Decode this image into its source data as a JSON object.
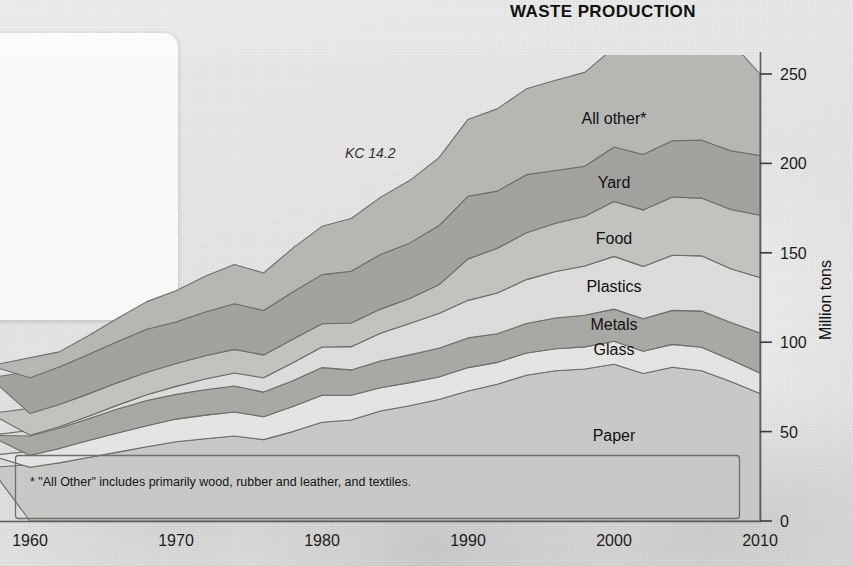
{
  "card": {
    "heading": "we\nle?",
    "subhead": "rents did.",
    "body": "olid waste in\nastic products\ncovery rates\ntes plastics\ncause"
  },
  "chart": {
    "title": "WASTE PRODUCTION",
    "annotation": "KC 14.2",
    "footnote": "* \"All Other\" includes primarily wood, rubber and leather, and textiles.",
    "y_axis_title": "Million tons"
  },
  "colors": {
    "band_paper": "#c9cac7",
    "band_glass": "#e5e6e3",
    "band_metals": "#a9aaa6",
    "band_plastics": "#dddedb",
    "band_food": "#c3c4c0",
    "band_yard": "#a3a4a0",
    "band_all_other": "#b7b8b4",
    "stroke": "#6e6f6b",
    "axis": "#5c5d5a",
    "text": "#141414"
  },
  "chart_data": {
    "type": "area",
    "title": "WASTE PRODUCTION",
    "xlabel": "",
    "ylabel": "Million tons",
    "xlim": [
      1960,
      2010
    ],
    "ylim": [
      0,
      250
    ],
    "yticks": [
      0,
      50,
      100,
      150,
      200,
      250
    ],
    "xticks": [
      1960,
      1970,
      1980,
      1990,
      2000,
      2010
    ],
    "grid": false,
    "legend": "inline-labels",
    "stacked": true,
    "x": [
      1960,
      1962,
      1964,
      1966,
      1968,
      1970,
      1972,
      1974,
      1976,
      1978,
      1980,
      1982,
      1984,
      1986,
      1988,
      1990,
      1992,
      1994,
      1996,
      1998,
      2000,
      2002,
      2004,
      2006,
      2008,
      2010
    ],
    "series": [
      {
        "name": "Paper",
        "values": [
          30.0,
          32.5,
          35.5,
          38.5,
          41.5,
          44.3,
          46.0,
          47.5,
          45.5,
          50.0,
          55.2,
          56.5,
          61.5,
          64.5,
          68.0,
          72.7,
          76.5,
          81.5,
          84.0,
          85.0,
          87.7,
          82.5,
          86.0,
          84.0,
          78.0,
          71.3
        ]
      },
      {
        "name": "Glass",
        "values": [
          6.7,
          8.0,
          9.5,
          10.7,
          11.8,
          12.7,
          13.2,
          13.5,
          12.8,
          14.0,
          15.1,
          13.8,
          13.0,
          12.9,
          12.5,
          13.1,
          12.2,
          12.5,
          12.3,
          12.4,
          12.8,
          12.4,
          12.8,
          13.2,
          12.2,
          11.5
        ]
      },
      {
        "name": "Metals",
        "values": [
          10.8,
          11.4,
          12.2,
          13.4,
          14.1,
          13.8,
          14.2,
          14.5,
          13.8,
          14.5,
          15.5,
          14.2,
          15.0,
          15.5,
          16.1,
          16.6,
          16.0,
          16.5,
          17.2,
          17.7,
          18.0,
          18.2,
          19.0,
          20.2,
          20.8,
          22.4
        ]
      },
      {
        "name": "Plastics",
        "values": [
          0.4,
          0.8,
          1.4,
          2.2,
          3.2,
          4.5,
          6.0,
          7.3,
          8.0,
          10.0,
          11.5,
          13.0,
          15.5,
          17.5,
          19.5,
          21.0,
          22.8,
          24.5,
          26.0,
          27.5,
          29.5,
          29.3,
          30.8,
          30.9,
          30.1,
          31.0
        ]
      },
      {
        "name": "Food",
        "values": [
          12.2,
          12.4,
          12.5,
          12.6,
          12.6,
          12.8,
          13.0,
          13.2,
          12.8,
          13.1,
          13.0,
          13.2,
          13.5,
          14.0,
          16.0,
          23.2,
          25.0,
          26.2,
          27.0,
          27.8,
          30.7,
          31.6,
          32.6,
          32.3,
          33.1,
          34.8
        ]
      },
      {
        "name": "Yard",
        "values": [
          20.0,
          21.0,
          22.0,
          23.0,
          24.0,
          23.2,
          24.5,
          25.5,
          24.8,
          26.5,
          27.5,
          29.0,
          30.5,
          31.0,
          33.0,
          35.0,
          32.0,
          32.5,
          29.5,
          28.0,
          30.5,
          31.0,
          31.5,
          32.4,
          32.9,
          33.4
        ]
      },
      {
        "name": "All other*",
        "values": [
          6.7,
          8.5,
          10.5,
          13.0,
          15.5,
          17.5,
          20.0,
          22.0,
          21.0,
          24.5,
          27.0,
          29.5,
          32.0,
          35.0,
          38.0,
          43.0,
          46.0,
          48.0,
          50.5,
          52.5,
          55.5,
          56.5,
          58.0,
          60.0,
          61.0,
          45.6
        ]
      }
    ],
    "series_totals_endpoints": {
      "1960": 86.8,
      "2010": 250.0
    },
    "series_labels_positions": [
      {
        "name": "All other*",
        "x": 2000,
        "y": 222
      },
      {
        "name": "Yard",
        "x": 2000,
        "y": 186
      },
      {
        "name": "Food",
        "x": 2000,
        "y": 155
      },
      {
        "name": "Plastics",
        "x": 2000,
        "y": 128
      },
      {
        "name": "Metals",
        "x": 2000,
        "y": 107
      },
      {
        "name": "Glass",
        "x": 2000,
        "y": 93
      },
      {
        "name": "Paper",
        "x": 2000,
        "y": 45
      }
    ]
  }
}
